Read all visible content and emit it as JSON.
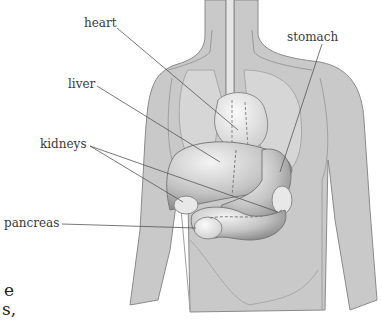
{
  "figure": {
    "labels": {
      "heart": "heart",
      "stomach": "stomach",
      "liver": "liver",
      "kidneys": "kidneys",
      "pancreas": "pancreas"
    },
    "cropped_text": {
      "line1": "e",
      "line2": "s,"
    },
    "colors": {
      "body": "#c8c8c8",
      "body_outline": "#8a8a8a",
      "organ": "#dcdcdc",
      "organ_dark": "#9e9e9e",
      "leader_line": "#555555",
      "label_text": "#3a3a3a"
    }
  }
}
